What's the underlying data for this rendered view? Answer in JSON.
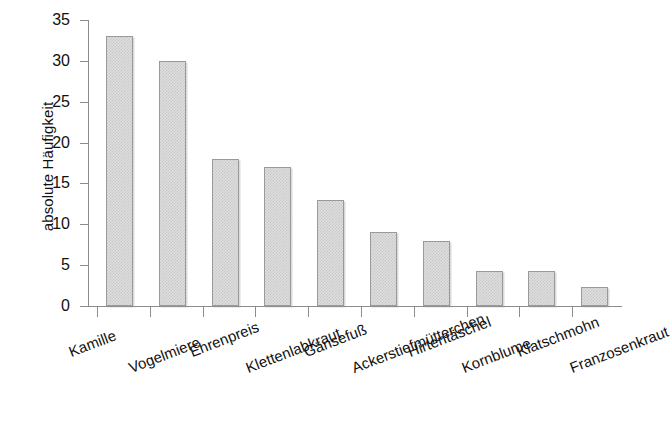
{
  "chart_data": {
    "type": "bar",
    "title": "",
    "xlabel": "",
    "ylabel": "absolute Häufigkeit",
    "ylim": [
      0,
      35
    ],
    "yticks": [
      0,
      5,
      10,
      15,
      20,
      25,
      30,
      35
    ],
    "grid": false,
    "legend": null,
    "categories": [
      "Kamille",
      "Vogelmiere",
      "Ehrenpreis",
      "Klettenlabkraut",
      "Gänsefuß",
      "Ackerstiefmütterchen",
      "Hirtentäschel",
      "Kornblume",
      "Klatschmohn",
      "Franzosenkraut"
    ],
    "values": [
      33,
      30,
      18,
      17,
      13,
      9,
      8,
      4.3,
      4.3,
      2.3
    ],
    "bar_style": {
      "fill": "#dedede",
      "pattern": "stipple-checker",
      "border": "#9a9a9a",
      "axis_color": "#8c8c8c"
    },
    "label_rotation_deg": -21,
    "label_stagger": "two-row alternating"
  }
}
